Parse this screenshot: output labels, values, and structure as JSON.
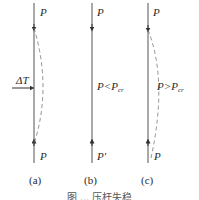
{
  "figure": {
    "colors": {
      "line": "#555555",
      "dashed": "#777777",
      "text": "#2a2a2a"
    },
    "panels": [
      {
        "id": "a",
        "label": "(a)",
        "top_load": "P",
        "bottom_load": "P",
        "side_load": "ΔT",
        "deflected_shape": "dashed bow to the right"
      },
      {
        "id": "b",
        "label": "(b)",
        "top_load": "P",
        "bottom_load": "P′",
        "condition": {
          "lhs": "P<P",
          "sub": "cr"
        },
        "deflected_shape": "none (straight)"
      },
      {
        "id": "c",
        "label": "(c)",
        "top_load": "P",
        "bottom_load": "P",
        "condition": {
          "lhs": "P>P",
          "sub": "cr"
        },
        "deflected_shape": "dashed bow to the right (buckled)"
      }
    ],
    "caption": "图 ... 压杆失稳"
  }
}
